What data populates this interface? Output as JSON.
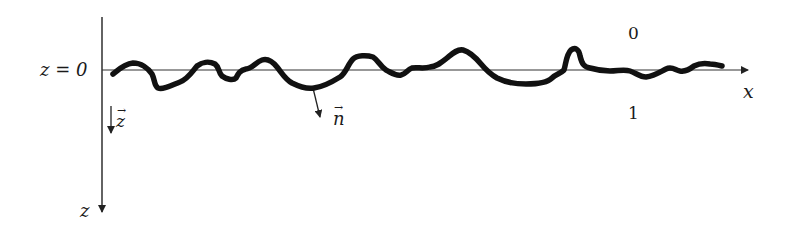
{
  "diagram": {
    "type": "rough-interface-sketch",
    "colors": {
      "background": "#ffffff",
      "axis": "#222222",
      "interface": "#111111"
    },
    "labels": {
      "z_zero": "z = 0",
      "x_axis": "x",
      "z_axis": "z",
      "z_unit_vector": "z",
      "normal_vector": "n",
      "region_above": "0",
      "region_below": "1",
      "vector_arrow": "→"
    },
    "axes": {
      "horizontal": {
        "name": "x",
        "direction": "right",
        "y_position": "z = 0"
      },
      "vertical": {
        "name": "z",
        "direction": "down"
      }
    },
    "vectors": [
      {
        "name": "z-unit-vector",
        "label": "z",
        "direction": "down"
      },
      {
        "name": "normal-vector",
        "label": "n",
        "direction": "down-right from interface"
      }
    ],
    "regions": [
      {
        "name": "medium-0",
        "label": "0",
        "position": "above interface"
      },
      {
        "name": "medium-1",
        "label": "1",
        "position": "below interface"
      }
    ]
  }
}
